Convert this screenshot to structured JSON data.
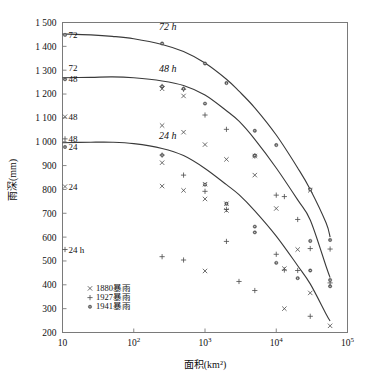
{
  "chart_data": {
    "type": "scatter",
    "title": "",
    "xlabel": "面积(km²)",
    "ylabel": "雨深(mm)",
    "xscale": "log",
    "yscale": "linear",
    "xlim": [
      10,
      100000
    ],
    "ylim": [
      200,
      1500
    ],
    "grid": false,
    "legend_position": "bottom-left",
    "xticklabels": [
      "10",
      "10²",
      "10³",
      "10⁴",
      "10⁵"
    ],
    "xtickvalues": [
      10,
      100,
      1000,
      10000,
      100000
    ],
    "yticklabels": [
      "200",
      "300",
      "400",
      "500",
      "600",
      "700",
      "800",
      "900",
      "1 000",
      "1 100",
      "1 200",
      "1 300",
      "1 400",
      "1 500"
    ],
    "ytickvalues": [
      200,
      300,
      400,
      500,
      600,
      700,
      800,
      900,
      1000,
      1100,
      1200,
      1300,
      1400,
      1500
    ],
    "legend": [
      {
        "marker": "x",
        "label": "1880暴雨"
      },
      {
        "marker": "+",
        "label": "1927暴雨"
      },
      {
        "marker": "*",
        "label": "1941暴雨"
      }
    ],
    "annotations": [
      {
        "text": "72 h",
        "x": 300,
        "y": 1468,
        "italic": true
      },
      {
        "text": "48 h",
        "x": 300,
        "y": 1292,
        "italic": true
      },
      {
        "text": "24 h",
        "x": 300,
        "y": 1012,
        "italic": true
      }
    ],
    "edge_labels": [
      {
        "marker": "*",
        "text": "72",
        "y": 1448
      },
      {
        "marker": "",
        "text": "72",
        "y": 1312
      },
      {
        "marker": "*",
        "text": "48",
        "y": 1262
      },
      {
        "marker": "x",
        "text": "48",
        "y": 1105
      },
      {
        "marker": "+",
        "text": "48",
        "y": 1012
      },
      {
        "marker": "*",
        "text": "24",
        "y": 978
      },
      {
        "marker": "x",
        "text": "24",
        "y": 812
      },
      {
        "marker": "+",
        "text": "24 h",
        "y": 548
      }
    ],
    "curves": [
      {
        "name": "72 h",
        "points": [
          [
            10,
            1452
          ],
          [
            25,
            1448
          ],
          [
            50,
            1442
          ],
          [
            100,
            1432
          ],
          [
            250,
            1408
          ],
          [
            500,
            1378
          ],
          [
            1000,
            1330
          ],
          [
            2000,
            1262
          ],
          [
            3000,
            1212
          ],
          [
            5000,
            1142
          ],
          [
            10000,
            1028
          ],
          [
            20000,
            890
          ],
          [
            30000,
            800
          ],
          [
            50000,
            660
          ],
          [
            57000,
            600
          ]
        ]
      },
      {
        "name": "48 h",
        "points": [
          [
            10,
            1268
          ],
          [
            25,
            1270
          ],
          [
            50,
            1272
          ],
          [
            100,
            1268
          ],
          [
            250,
            1255
          ],
          [
            500,
            1236
          ],
          [
            1000,
            1196
          ],
          [
            2000,
            1130
          ],
          [
            3000,
            1086
          ],
          [
            5000,
            1010
          ],
          [
            10000,
            890
          ],
          [
            20000,
            756
          ],
          [
            30000,
            672
          ],
          [
            50000,
            478
          ],
          [
            57000,
            430
          ]
        ]
      },
      {
        "name": "24 h",
        "points": [
          [
            10,
            996
          ],
          [
            25,
            998
          ],
          [
            50,
            998
          ],
          [
            100,
            992
          ],
          [
            250,
            972
          ],
          [
            500,
            942
          ],
          [
            1000,
            888
          ],
          [
            2000,
            820
          ],
          [
            3000,
            778
          ],
          [
            5000,
            710
          ],
          [
            10000,
            604
          ],
          [
            20000,
            480
          ],
          [
            30000,
            404
          ],
          [
            50000,
            278
          ],
          [
            57000,
            248
          ]
        ]
      }
    ],
    "series": [
      {
        "name": "1880暴雨",
        "marker": "x",
        "points": [
          [
            250,
            1222
          ],
          [
            500,
            1192
          ],
          [
            250,
            1068
          ],
          [
            500,
            1040
          ],
          [
            1000,
            988
          ],
          [
            250,
            912
          ],
          [
            2000,
            926
          ],
          [
            5000,
            860
          ],
          [
            250,
            814
          ],
          [
            500,
            796
          ],
          [
            1000,
            822
          ],
          [
            1000,
            760
          ],
          [
            2000,
            712
          ],
          [
            10000,
            720
          ],
          [
            13000,
            468
          ],
          [
            20000,
            548
          ],
          [
            30000,
            366
          ],
          [
            1000,
            458
          ],
          [
            13000,
            300
          ],
          [
            57000,
            228
          ],
          [
            30000,
            796
          ],
          [
            5000,
            940
          ],
          [
            2000,
            740
          ]
        ]
      },
      {
        "name": "1927暴雨",
        "marker": "+",
        "points": [
          [
            250,
            1232
          ],
          [
            500,
            1220
          ],
          [
            1000,
            1112
          ],
          [
            2000,
            1052
          ],
          [
            5000,
            940
          ],
          [
            10000,
            776
          ],
          [
            13000,
            770
          ],
          [
            20000,
            674
          ],
          [
            30000,
            552
          ],
          [
            500,
            860
          ],
          [
            250,
            944
          ],
          [
            1000,
            792
          ],
          [
            2000,
            716
          ],
          [
            2000,
            582
          ],
          [
            3000,
            414
          ],
          [
            5000,
            376
          ],
          [
            10000,
            528
          ],
          [
            250,
            518
          ],
          [
            500,
            504
          ],
          [
            13000,
            462
          ],
          [
            20000,
            460
          ],
          [
            30000,
            268
          ],
          [
            57000,
            408
          ],
          [
            57000,
            550
          ]
        ]
      },
      {
        "name": "1941暴雨",
        "marker": "*",
        "points": [
          [
            250,
            1412
          ],
          [
            1000,
            1328
          ],
          [
            2000,
            1246
          ],
          [
            250,
            1232
          ],
          [
            500,
            1222
          ],
          [
            1000,
            1160
          ],
          [
            5000,
            1046
          ],
          [
            5000,
            942
          ],
          [
            10000,
            986
          ],
          [
            30000,
            800
          ],
          [
            250,
            944
          ],
          [
            1000,
            820
          ],
          [
            2000,
            740
          ],
          [
            5000,
            644
          ],
          [
            5000,
            620
          ],
          [
            10000,
            492
          ],
          [
            20000,
            428
          ],
          [
            30000,
            584
          ],
          [
            57000,
            588
          ],
          [
            57000,
            420
          ],
          [
            57000,
            394
          ],
          [
            30000,
            460
          ]
        ]
      }
    ]
  },
  "figure": {
    "background": "#ffffff",
    "frame_color": "#7a7a7a",
    "curve_color": "#3a3a3a",
    "marker_color": "#4a4a4a"
  }
}
